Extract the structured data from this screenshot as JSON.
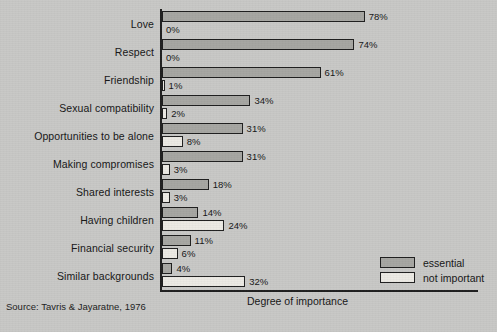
{
  "chart_data": {
    "type": "bar",
    "orientation": "horizontal",
    "title": "",
    "xlabel": "Degree of importance",
    "ylabel": "",
    "xlim": [
      0,
      80
    ],
    "grid": false,
    "legend_position": "bottom-right",
    "value_suffix": "%",
    "categories": [
      "Love",
      "Respect",
      "Friendship",
      "Sexual compatibility",
      "Opportunities to be alone",
      "Making compromises",
      "Shared interests",
      "Having children",
      "Financial security",
      "Similar backgrounds"
    ],
    "series": [
      {
        "name": "essential",
        "color": "#a6a6a2",
        "values": [
          78,
          74,
          61,
          34,
          31,
          31,
          18,
          14,
          11,
          4
        ],
        "labels": [
          "78%",
          "74%",
          "61%",
          "34%",
          "31%",
          "31%",
          "18%",
          "14%",
          "11%",
          "4%"
        ]
      },
      {
        "name": "not important",
        "color": "#eceae4",
        "values": [
          0,
          0,
          1,
          2,
          8,
          3,
          3,
          24,
          6,
          32
        ],
        "labels": [
          "0%",
          "0%",
          "1%",
          "2%",
          "8%",
          "3%",
          "3%",
          "24%",
          "6%",
          "32%"
        ]
      }
    ]
  },
  "legend": {
    "items": [
      {
        "label": "essential",
        "color": "#a6a6a2"
      },
      {
        "label": "not important",
        "color": "#eceae4"
      }
    ]
  },
  "axis": {
    "x_title": "Degree of importance"
  },
  "source": {
    "text": "Source: Tavris & Jayaratne, 1976"
  },
  "layout": {
    "plot_left_px": 161,
    "plot_top_px": 9,
    "plot_bottom_px": 291,
    "px_per_percent": 2.6,
    "row_height_px": 28
  }
}
